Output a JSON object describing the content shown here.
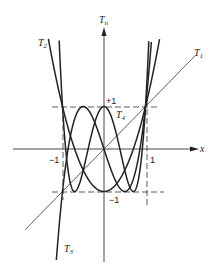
{
  "figure": {
    "axes": {
      "x_label": "x",
      "y_label": "T",
      "y_label_sub": "n",
      "origin_px": [
        104,
        149
      ],
      "unit_x_px": 41.5,
      "unit_y_px": 42.5,
      "x_range": [
        -1.9,
        2.2
      ],
      "y_range": [
        -2.7,
        2.6
      ]
    },
    "ticks": {
      "x_neg_one": "−1",
      "x_pos_one": "1",
      "y_pos_one": "+1",
      "y_neg_one": "−1"
    },
    "curves": [
      {
        "name": "T1",
        "label": "T",
        "sub": "1",
        "coeffs": [
          0,
          1
        ]
      },
      {
        "name": "T2",
        "label": "T",
        "sub": "2",
        "coeffs": [
          -1,
          0,
          2
        ]
      },
      {
        "name": "T3",
        "label": "T",
        "sub": "3",
        "coeffs": [
          0,
          -3,
          0,
          4
        ]
      },
      {
        "name": "T4",
        "label": "T",
        "sub": "4",
        "coeffs": [
          1,
          0,
          -8,
          0,
          8
        ]
      }
    ],
    "colors": {
      "ink": "#222222",
      "thin": "#333333"
    }
  }
}
